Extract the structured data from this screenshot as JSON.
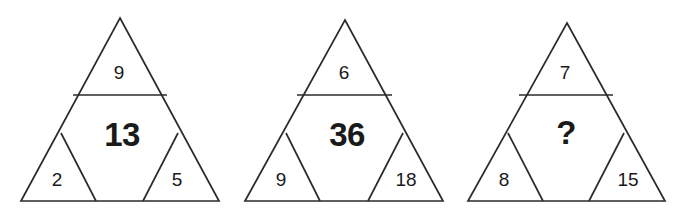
{
  "figure": {
    "kind": "three-partitioned-triangles",
    "background_color": "#ffffff",
    "line_color": "#2b2b2b",
    "text_color": "#1a1a1a"
  },
  "triangles": [
    {
      "name": "triangle-1",
      "top": "9",
      "center": "13",
      "bottom_left": "2",
      "bottom_right": "5",
      "geometry": {
        "apex_x": 120,
        "apex_y": 18,
        "left_x": 21,
        "right_x": 219,
        "base_y": 201,
        "divider_y": 95,
        "divider_left_x": 73,
        "divider_right_x": 167,
        "left_sub_apex_x": 61,
        "left_sub_apex_y": 133,
        "left_sub_base_x": 96,
        "right_sub_apex_x": 178,
        "right_sub_apex_y": 133,
        "right_sub_base_x": 143
      },
      "label_pos": {
        "top_x": 119,
        "top_y": 73,
        "center_x": 122,
        "center_y": 136,
        "bl_x": 57,
        "bl_y": 180,
        "br_x": 177,
        "br_y": 180
      }
    },
    {
      "name": "triangle-2",
      "top": "6",
      "center": "36",
      "bottom_left": "9",
      "bottom_right": "18",
      "geometry": {
        "apex_x": 345,
        "apex_y": 20,
        "left_x": 245,
        "right_x": 443,
        "base_y": 201,
        "divider_y": 95,
        "divider_left_x": 297,
        "divider_right_x": 392,
        "left_sub_apex_x": 286,
        "left_sub_apex_y": 133,
        "left_sub_base_x": 320,
        "right_sub_apex_x": 403,
        "right_sub_apex_y": 133,
        "right_sub_base_x": 368
      },
      "label_pos": {
        "top_x": 344,
        "top_y": 73,
        "center_x": 347,
        "center_y": 136,
        "bl_x": 281,
        "bl_y": 180,
        "br_x": 406,
        "br_y": 180
      }
    },
    {
      "name": "triangle-3",
      "top": "7",
      "center": "?",
      "bottom_left": "8",
      "bottom_right": "15",
      "geometry": {
        "apex_x": 567,
        "apex_y": 23,
        "left_x": 468,
        "right_x": 665,
        "base_y": 201,
        "divider_y": 95,
        "divider_left_x": 519,
        "divider_right_x": 613,
        "left_sub_apex_x": 508,
        "left_sub_apex_y": 133,
        "left_sub_base_x": 543,
        "right_sub_apex_x": 624,
        "right_sub_apex_y": 133,
        "right_sub_base_x": 589
      },
      "label_pos": {
        "top_x": 565,
        "top_y": 73,
        "center_x": 566,
        "center_y": 134,
        "bl_x": 504,
        "bl_y": 180,
        "br_x": 628,
        "br_y": 180
      }
    }
  ]
}
